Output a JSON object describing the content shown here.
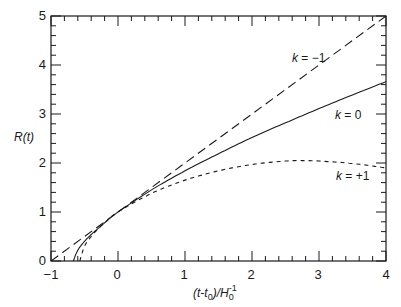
{
  "chart_data": {
    "type": "line",
    "title": "",
    "xlabel": "(t-t0)/H0^-1",
    "ylabel": "R(t)",
    "xlim": [
      -1,
      4
    ],
    "ylim": [
      0,
      5
    ],
    "grid": false,
    "legend": "inline annotations",
    "xticks": [
      "-1",
      "0",
      "1",
      "2",
      "3",
      "4"
    ],
    "yticks": [
      "0",
      "1",
      "2",
      "3",
      "4",
      "5"
    ],
    "series": [
      {
        "name": "k = -1",
        "style": "long-dash",
        "x": [
          -1,
          0,
          1,
          2,
          3,
          4
        ],
        "y": [
          0,
          1,
          2,
          3,
          4,
          5
        ]
      },
      {
        "name": "k = 0",
        "style": "solid",
        "x": [
          -0.667,
          -0.6,
          -0.5,
          -0.4,
          -0.3,
          -0.2,
          0,
          0.5,
          1,
          1.5,
          2,
          2.5,
          3,
          3.5,
          4
        ],
        "y": [
          0,
          0.22,
          0.4,
          0.54,
          0.66,
          0.78,
          1.0,
          1.45,
          1.84,
          2.19,
          2.52,
          2.82,
          3.11,
          3.39,
          3.66
        ]
      },
      {
        "name": "k = +1",
        "style": "short-dash",
        "x": [
          -0.57,
          -0.5,
          -0.4,
          -0.3,
          -0.2,
          0,
          0.5,
          1,
          1.5,
          2,
          2.5,
          2.75,
          3,
          3.5,
          4
        ],
        "y": [
          0,
          0.3,
          0.5,
          0.65,
          0.78,
          1.0,
          1.38,
          1.65,
          1.84,
          1.97,
          2.04,
          2.05,
          2.04,
          1.99,
          1.9
        ]
      }
    ],
    "annotations": [
      {
        "text": "k = -1",
        "x": 2.55,
        "y": 3.95
      },
      {
        "text": "k = 0",
        "x": 3.15,
        "y": 2.75
      },
      {
        "text": "k = +1",
        "x": 3.3,
        "y": 1.6
      }
    ]
  },
  "labels": {
    "ylabel": "R(t)",
    "xlabel_pre": "(t-t",
    "xlabel_sub0": "0",
    "xlabel_mid": ")/H",
    "xlabel_sub": "0",
    "xlabel_sup": "-1",
    "k_neg_prefix": "k",
    "k_neg_val": " = −1",
    "k_zero_prefix": "k",
    "k_zero_val": " = 0",
    "k_pos_prefix": "k",
    "k_pos_val": " = +1",
    "xt0": "−1",
    "xt1": "0",
    "xt2": "1",
    "xt3": "2",
    "xt4": "3",
    "xt5": "4",
    "yt0": "0",
    "yt1": "1",
    "yt2": "2",
    "yt3": "3",
    "yt4": "4",
    "yt5": "5"
  }
}
